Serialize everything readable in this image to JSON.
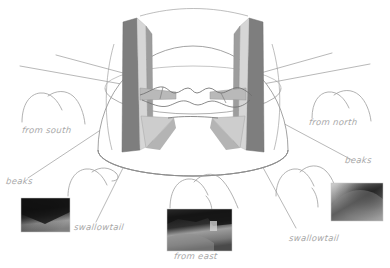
{
  "figure": {
    "background_color": "#ffffff",
    "line_color": "#8c8c8c",
    "label_color": "#a8a8a8",
    "shade_dark": "#7f7f7f",
    "shade_mid": "#9a9a9a",
    "shade_light": "#cfcfcf",
    "shade_pale": "#e2e2e2"
  },
  "labels": {
    "from_south": "from south",
    "from_north": "from north",
    "from_east": "from east",
    "beaks_left": "beaks",
    "beaks_right": "beaks",
    "swallowtail_left": "swallowtail",
    "swallowtail_right": "swallowtail"
  },
  "sketches": [
    {
      "name": "beaks-profile-south",
      "caption": "from south"
    },
    {
      "name": "beaks-profile-north",
      "caption": "from north"
    },
    {
      "name": "beaks-profile-lower-left",
      "caption": "beaks"
    },
    {
      "name": "beaks-profile-east",
      "caption": "from east"
    },
    {
      "name": "beaks-profile-lower-right",
      "caption": "beaks"
    }
  ],
  "photos": [
    {
      "name": "photo-inset-southwest",
      "position": "bottom-left",
      "tone": "dark"
    },
    {
      "name": "photo-inset-east",
      "position": "bottom-center",
      "tone": "mixed"
    },
    {
      "name": "photo-inset-northeast",
      "position": "right",
      "tone": "mid"
    }
  ],
  "geometry": {
    "dome_center_x": 193,
    "dome_center_y": 92,
    "dome_radius_x": 95,
    "dome_radius_y": 80,
    "band_count": 2,
    "description": "Hemispherical dome with two steeply dipping shaded bands and a central wavy swallowtail trace"
  }
}
